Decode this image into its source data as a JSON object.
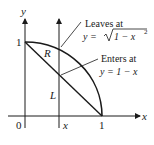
{
  "diagram": {
    "axes": {
      "x_label": "x",
      "y_label": "y",
      "origin_label": "0",
      "x_tick_label": "1",
      "y_tick_label": "1",
      "vertical_line_label": "x"
    },
    "region_labels": {
      "region": "R",
      "line": "L"
    },
    "annotations": {
      "leaves_title": "Leaves at",
      "leaves_eq_lhs": "y = ",
      "leaves_eq_rad": "1 − x",
      "leaves_eq_exp": "2",
      "enters_title": "Enters at",
      "enters_eq": "y = 1 − x"
    },
    "colors": {
      "stroke": "#1a1a1a",
      "background": "#ffffff"
    }
  }
}
